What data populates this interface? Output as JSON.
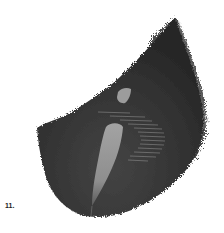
{
  "figure": {
    "label": "11.",
    "colors": {
      "background": "#ffffff",
      "body_dark": "#2b2b2b",
      "body_mid": "#3a3a3a",
      "inclusion_light": "#9a9a9a",
      "stripes": "#8c8c8c",
      "label": "#222222"
    }
  }
}
